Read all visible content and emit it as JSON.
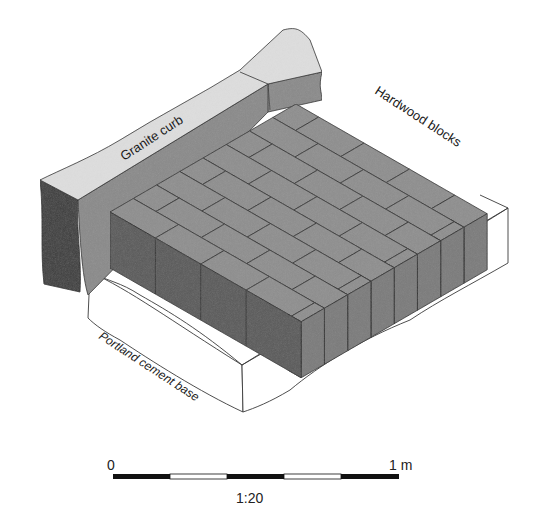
{
  "figure": {
    "type": "isometric cutaway diagram"
  },
  "labels": {
    "curb": "Granite curb",
    "blocks": "Hardwood blocks",
    "base": "Portland cement base"
  },
  "scale_bar": {
    "start_label": "0",
    "end_label": "1 m",
    "ratio": "1:20",
    "segments": [
      "black",
      "white",
      "black",
      "white",
      "black"
    ]
  },
  "colors": {
    "background": "#ffffff",
    "curb_top": "#dcdcdc",
    "curb_front": "#8a8a8a",
    "curb_end": "#3c3c3c",
    "block_top": "#8e8e8e",
    "block_front": "#5a5a5a",
    "block_side": "#7a7a7a",
    "base": "#ffffff",
    "outline": "#2a2a2a"
  }
}
